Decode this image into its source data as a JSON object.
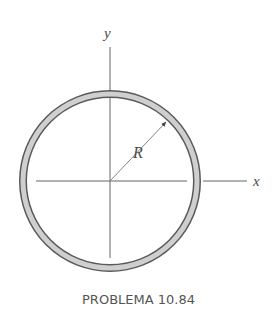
{
  "figure": {
    "caption": "PROBLEMA 10.84",
    "labels": {
      "y_axis": "y",
      "x_axis": "x",
      "radius": "R"
    },
    "colors": {
      "ring_fill": "#c8c8c8",
      "ring_edge": "#5a5a5a",
      "axis": "#555555",
      "text": "#4a4a4a"
    },
    "geometry": {
      "center": [
        110,
        181
      ],
      "outer_radius": 91,
      "ring_thickness": 8
    }
  }
}
